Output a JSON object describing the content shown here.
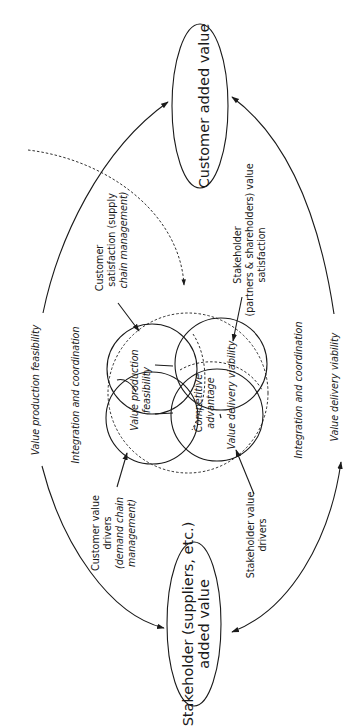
{
  "diagram": {
    "nodes": {
      "customer_added_value": "Customer added value",
      "stakeholder_added_value_line1": "Stakeholder (suppliers, etc.)",
      "stakeholder_added_value_line2": "added value"
    },
    "outer_labels": {
      "left_outer": "Value production feasibility",
      "left_inner": "Integration and coordination",
      "right_inner": "Integration and coordination",
      "right_outer": "Value delivery viability"
    },
    "annotations": {
      "customer_satisfaction": [
        "Customer",
        "satisfaction (supply",
        "chain management)"
      ],
      "stakeholder_satisfaction": [
        "Stakeholder",
        "(partners & shareholders) value",
        "satisfaction"
      ],
      "customer_value_drivers": [
        "Customer value",
        "drivers",
        "(demand chain",
        "management)"
      ],
      "stakeholder_value_drivers": [
        "Stakeholder value",
        "drivers"
      ]
    },
    "circles": {
      "value_production": [
        "Value production",
        "feasibility"
      ],
      "competitive_advantage": [
        "Competitive",
        "advantage"
      ],
      "value_delivery": "Value delivery viability"
    }
  }
}
